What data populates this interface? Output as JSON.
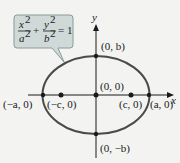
{
  "equation": {
    "x_num": "x",
    "x_den": "a",
    "y_num": "y",
    "y_den": "b",
    "exp": "2",
    "plus": "+",
    "equals": "= 1"
  },
  "axes": {
    "x_label": "x",
    "y_label": "y"
  },
  "points": {
    "top": "(0, b)",
    "bottom": "(0, −b)",
    "origin": "(0, 0)",
    "left_vertex": "(−a, 0)",
    "right_vertex": "(a, 0)",
    "left_focus": "(−c, 0)",
    "right_focus": "(c, 0)"
  },
  "colors": {
    "ellipse": "#4a4a4a",
    "callout_fill": "#cfd9d8",
    "callout_stroke": "#8a9a99",
    "axis": "#1a1a1a",
    "background": "#f3f3f2"
  }
}
